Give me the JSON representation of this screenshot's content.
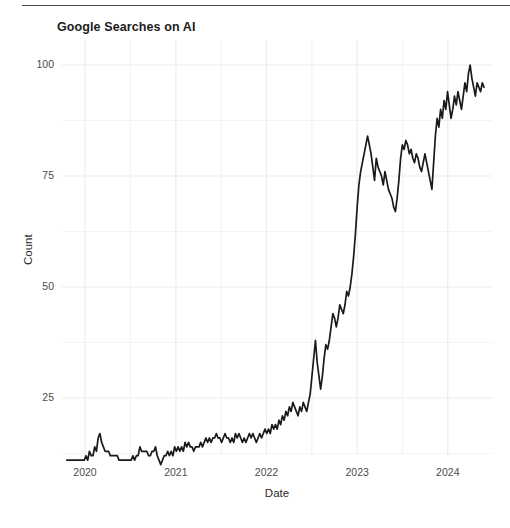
{
  "figure": {
    "title": "Google Searches on AI",
    "top_rule": true
  },
  "axes": {
    "x_title": "Date",
    "y_title": "Count",
    "x_ticks": [
      "2020",
      "2021",
      "2022",
      "2023",
      "2024"
    ],
    "y_ticks": [
      "25",
      "50",
      "75",
      "100"
    ]
  },
  "style": {
    "line_color": "#1a1a1a",
    "grid_color": "#ebebeb",
    "background": "#ffffff",
    "tick_text_color": "#4d4d4d"
  },
  "chart_data": {
    "type": "line",
    "title": "Google Searches on AI",
    "xlabel": "Date",
    "ylabel": "Count",
    "xlim": [
      "2019-10-20",
      "2024-06-02"
    ],
    "ylim": [
      0,
      104
    ],
    "x_tick_values": [
      "2020-01-01",
      "2021-01-01",
      "2022-01-01",
      "2023-01-01",
      "2024-01-01"
    ],
    "x_tick_labels": [
      "2020",
      "2021",
      "2022",
      "2023",
      "2024"
    ],
    "y_tick_values": [
      25,
      50,
      75,
      100
    ],
    "y_tick_labels": [
      "25",
      "50",
      "75",
      "100"
    ],
    "grid": true,
    "legend": "none",
    "series": [
      {
        "name": "Google Searches on AI",
        "x_start": "2019-10-20",
        "x_step_days": 7,
        "values": [
          11,
          11,
          11,
          11,
          11,
          11,
          11,
          11,
          11,
          11,
          11,
          12,
          11,
          13,
          12,
          12,
          14,
          13,
          16,
          17,
          15,
          14,
          13,
          13,
          13,
          12,
          12,
          12,
          12,
          12,
          11,
          11,
          11,
          11,
          11,
          11,
          11,
          11,
          12,
          11,
          12,
          12,
          14,
          13,
          13,
          13,
          13,
          12,
          12,
          13,
          13,
          14,
          12,
          11,
          10,
          11,
          12,
          12,
          13,
          12,
          13,
          12,
          14,
          13,
          14,
          13,
          14,
          13,
          15,
          14,
          15,
          14,
          14,
          13,
          14,
          14,
          14,
          15,
          14,
          15,
          16,
          15,
          16,
          15,
          16,
          16,
          17,
          16,
          16,
          15,
          16,
          17,
          16,
          16,
          15,
          16,
          15,
          17,
          16,
          17,
          16,
          15,
          16,
          15,
          16,
          17,
          16,
          17,
          16,
          15,
          16,
          17,
          16,
          17,
          18,
          17,
          18,
          17,
          19,
          18,
          19,
          18,
          20,
          19,
          21,
          20,
          22,
          21,
          23,
          22,
          24,
          23,
          22,
          21,
          23,
          22,
          24,
          23,
          22,
          24,
          26,
          30,
          34,
          38,
          33,
          30,
          27,
          30,
          34,
          37,
          36,
          38,
          41,
          44,
          43,
          41,
          43,
          46,
          45,
          44,
          46,
          49,
          48,
          50,
          53,
          57,
          62,
          68,
          73,
          76,
          78,
          80,
          82,
          84,
          82,
          80,
          77,
          74,
          79,
          77,
          76,
          75,
          73,
          76,
          74,
          72,
          71,
          70,
          68,
          67,
          70,
          74,
          79,
          82,
          81,
          83,
          82,
          80,
          81,
          79,
          78,
          80,
          79,
          77,
          76,
          78,
          80,
          78,
          76,
          74,
          72,
          78,
          84,
          88,
          86,
          90,
          88,
          92,
          90,
          94,
          91,
          88,
          90,
          93,
          91,
          94,
          92,
          90,
          93,
          96,
          94,
          98,
          100,
          97,
          95,
          93,
          96,
          95,
          94,
          96,
          95
        ]
      }
    ]
  }
}
